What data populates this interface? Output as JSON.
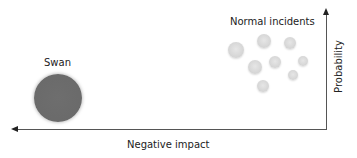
{
  "diagram": {
    "labels": {
      "swan": "Swan",
      "normal": "Normal incidents",
      "x_axis": "Negative impact",
      "y_axis": "Probability"
    },
    "swan": {
      "cx": 58,
      "cy": 98,
      "r": 24,
      "color": "#6b6b6b"
    },
    "normal_incidents": [
      {
        "cx": 236,
        "cy": 50,
        "r": 8
      },
      {
        "cx": 264,
        "cy": 41,
        "r": 7
      },
      {
        "cx": 290,
        "cy": 43,
        "r": 6
      },
      {
        "cx": 255,
        "cy": 67,
        "r": 7
      },
      {
        "cx": 275,
        "cy": 62,
        "r": 6
      },
      {
        "cx": 303,
        "cy": 61,
        "r": 5
      },
      {
        "cx": 293,
        "cy": 75,
        "r": 5
      },
      {
        "cx": 263,
        "cy": 86,
        "r": 6
      }
    ],
    "normal_color": "#d6d6d6",
    "axis_color": "#555555"
  }
}
